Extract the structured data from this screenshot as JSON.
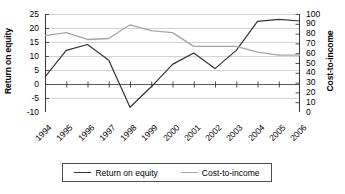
{
  "chart_data": {
    "type": "line",
    "title": "",
    "xlabel": "",
    "categories": [
      "1994",
      "1995",
      "1996",
      "1997",
      "1998",
      "1999",
      "2000",
      "2001",
      "2002",
      "2003",
      "2004",
      "2005",
      "2006"
    ],
    "grid": true,
    "legend_position": "bottom",
    "axes": {
      "left": {
        "label": "Return on equity",
        "ticks": [
          "25",
          "20",
          "15",
          "10",
          "5",
          "0",
          "-5",
          "-10"
        ],
        "tick_values": [
          25,
          20,
          15,
          10,
          5,
          0,
          -5,
          -10
        ],
        "ylim": [
          -10,
          25
        ]
      },
      "right": {
        "label": "Cost-to-income",
        "ticks": [
          "100",
          "90",
          "80",
          "70",
          "60",
          "50",
          "40",
          "30",
          "20",
          "10",
          "0"
        ],
        "tick_values": [
          100,
          90,
          80,
          70,
          60,
          50,
          40,
          30,
          20,
          10,
          0
        ],
        "ylim": [
          0,
          100
        ]
      }
    },
    "series": [
      {
        "name": "Return on equity",
        "axis": "left",
        "color": "#333333",
        "values": [
          2.5,
          12.0,
          14.1,
          8.5,
          -8.3,
          -1.0,
          7.0,
          11.1,
          5.5,
          12.0,
          22.4,
          23.1,
          22.5
        ]
      },
      {
        "name": "Cost-to-income",
        "axis": "right",
        "color": "#a6a6a6",
        "values": [
          78,
          81,
          74,
          75,
          89,
          83,
          81,
          67,
          67,
          67,
          61,
          58,
          58
        ]
      }
    ]
  },
  "legend": {
    "items": [
      {
        "label": "Return on equity",
        "color": "#333333"
      },
      {
        "label": "Cost-to-income",
        "color": "#a6a6a6"
      }
    ]
  }
}
